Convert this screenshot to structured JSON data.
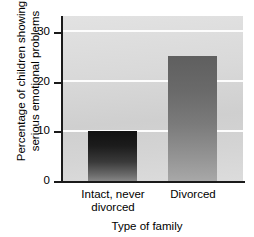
{
  "chart_data": {
    "type": "bar",
    "title": "",
    "subtitle": "",
    "categories": [
      "Intact, never divorced",
      "Divorced"
    ],
    "category_lines": [
      [
        "Intact, never",
        "divorced"
      ],
      [
        "Divorced"
      ]
    ],
    "values": [
      10,
      25
    ],
    "xlabel": "Type of family",
    "ylabel": "Percentage of children showing serious emotional problems",
    "ylabel_lines": [
      "Percentage of children showing",
      "serious emotional problems"
    ],
    "ylim": [
      0,
      33
    ],
    "yticks": [
      0,
      10,
      20,
      30
    ],
    "ytick_labels": [
      "0",
      "10",
      "20",
      "30"
    ],
    "grid": true,
    "gridline_color": "#fdfdfd",
    "legend": null,
    "legend_position": "none",
    "plot_background": "#d6d6d6",
    "axis_color": "#1a1a1a",
    "bar_colors": [
      "#2a2a2a",
      "#7b7b7b"
    ],
    "annotations": []
  }
}
